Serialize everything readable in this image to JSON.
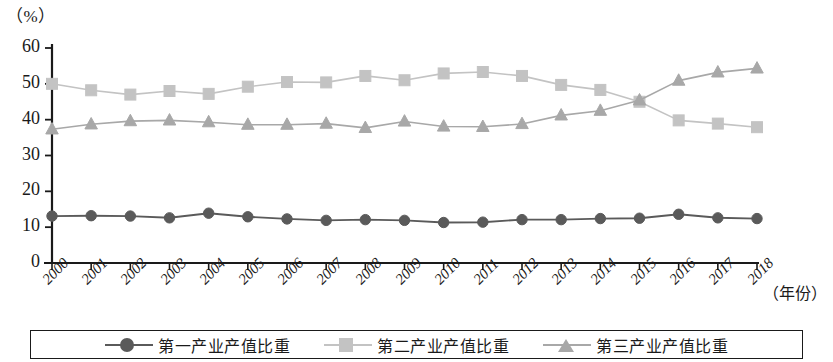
{
  "chart_data": {
    "type": "line",
    "title": "",
    "subtitle": "",
    "xlabel": "（年份）",
    "ylabel": "（%）",
    "x": [
      "2000",
      "2001",
      "2002",
      "2003",
      "2004",
      "2005",
      "2006",
      "2007",
      "2008",
      "2009",
      "2010",
      "2011",
      "2012",
      "2013",
      "2014",
      "2015",
      "2016",
      "2017",
      "2018"
    ],
    "categories": [
      "2000",
      "2001",
      "2002",
      "2003",
      "2004",
      "2005",
      "2006",
      "2007",
      "2008",
      "2009",
      "2010",
      "2011",
      "2012",
      "2013",
      "2014",
      "2015",
      "2016",
      "2017",
      "2018"
    ],
    "ylim": [
      0,
      60
    ],
    "yticks": [
      0,
      10,
      20,
      30,
      40,
      50,
      60
    ],
    "grid": false,
    "legend_position": "bottom",
    "series": [
      {
        "name": "第一产业产值比重",
        "marker": "circle",
        "color": "#5a5a5a",
        "values": [
          13.1,
          13.2,
          13.1,
          12.6,
          13.9,
          12.9,
          12.3,
          11.9,
          12.1,
          11.9,
          11.3,
          11.4,
          12.1,
          12.1,
          12.4,
          12.5,
          13.6,
          12.6,
          12.4
        ]
      },
      {
        "name": "第二产业产值比重",
        "marker": "square",
        "color": "#c3c3c3",
        "values": [
          50.0,
          48.2,
          47.0,
          48.0,
          47.2,
          49.2,
          50.5,
          50.4,
          52.2,
          51.0,
          52.9,
          53.3,
          52.2,
          49.7,
          48.3,
          45.0,
          39.8,
          38.9,
          37.9
        ]
      },
      {
        "name": "第三产业产值比重",
        "marker": "triangle",
        "color": "#a8a8a8",
        "values": [
          37.3,
          38.7,
          39.6,
          39.8,
          39.3,
          38.6,
          38.6,
          38.9,
          37.7,
          39.5,
          38.1,
          38.0,
          38.8,
          41.2,
          42.5,
          45.4,
          50.9,
          53.2,
          54.3
        ]
      }
    ]
  },
  "axis": {
    "unit_label": "（%）",
    "x_title": "（年份）",
    "y_tick_labels": [
      "60",
      "50",
      "40",
      "30",
      "20",
      "10",
      "0"
    ]
  },
  "legend": {
    "items": [
      {
        "label": "第一产业产值比重",
        "marker": "circle",
        "color": "#5a5a5a"
      },
      {
        "label": "第二产业产值比重",
        "marker": "square",
        "color": "#c3c3c3"
      },
      {
        "label": "第三产业产值比重",
        "marker": "triangle",
        "color": "#a8a8a8"
      }
    ]
  },
  "colors": {
    "axis": "#1a1a1a",
    "primary_series": "#5a5a5a",
    "secondary_series": "#c3c3c3",
    "tertiary_series": "#a8a8a8",
    "background": "#ffffff"
  }
}
